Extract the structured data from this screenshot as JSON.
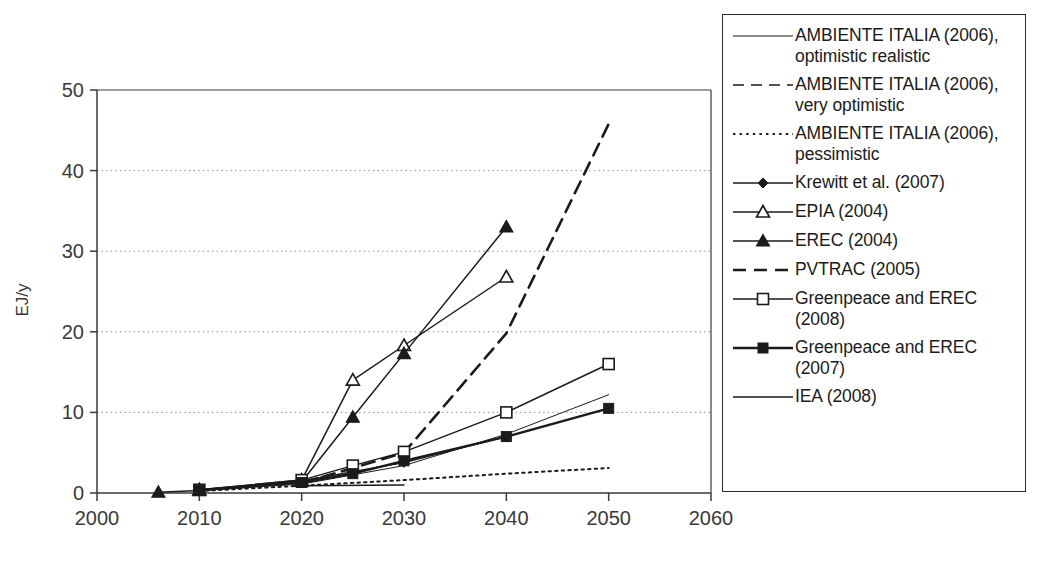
{
  "chart_data": {
    "type": "line",
    "title": "",
    "xlabel": "",
    "ylabel": "EJ/y",
    "xlim": [
      2000,
      2060
    ],
    "ylim": [
      0,
      50
    ],
    "xticks": [
      2000,
      2010,
      2020,
      2030,
      2040,
      2050,
      2060
    ],
    "yticks": [
      0,
      10,
      20,
      30,
      40,
      50
    ],
    "grid": "horizontal-dotted",
    "legend_position": "right-outside",
    "series": [
      {
        "name": "AMBIENTE ITALIA (2006), optimistic realistic",
        "style": "thin-solid",
        "marker": "none",
        "x": [
          2010,
          2020,
          2030,
          2040,
          2050
        ],
        "y": [
          0.3,
          1.1,
          3.4,
          7.3,
          12.2
        ]
      },
      {
        "name": "AMBIENTE ITALIA (2006), very optimistic",
        "style": "dashed",
        "marker": "none",
        "x": [
          2010,
          2020,
          2025
        ],
        "y": [
          0.4,
          1.4,
          3.0
        ]
      },
      {
        "name": "AMBIENTE ITALIA (2006), pessimistic",
        "style": "dotted",
        "marker": "none",
        "x": [
          2010,
          2020,
          2030,
          2040,
          2050
        ],
        "y": [
          0.25,
          0.9,
          1.6,
          2.4,
          3.1
        ]
      },
      {
        "name": "Krewitt et al. (2007)",
        "style": "solid",
        "marker": "filled-diamond",
        "x": [
          2010,
          2020,
          2030,
          2040
        ],
        "y": [
          0.35,
          1.5,
          3.8,
          7.0
        ]
      },
      {
        "name": "EPIA (2004)",
        "style": "solid",
        "marker": "open-triangle",
        "x": [
          2010,
          2020,
          2025,
          2030,
          2040
        ],
        "y": [
          0.4,
          1.6,
          14.0,
          18.3,
          26.8
        ]
      },
      {
        "name": "EREC (2004)",
        "style": "solid",
        "marker": "filled-triangle",
        "x": [
          2006,
          2010,
          2020,
          2025,
          2030,
          2040
        ],
        "y": [
          0.1,
          0.3,
          1.4,
          9.4,
          17.3,
          33.0
        ]
      },
      {
        "name": "PVTRAC (2005)",
        "style": "bold-dashed",
        "marker": "none",
        "x": [
          2020,
          2030,
          2040,
          2050
        ],
        "y": [
          1.2,
          5.0,
          19.8,
          45.8
        ]
      },
      {
        "name": "Greenpeace and EREC (2008)",
        "style": "solid",
        "marker": "open-square",
        "x": [
          2010,
          2020,
          2025,
          2030,
          2040,
          2050
        ],
        "y": [
          0.4,
          1.6,
          3.4,
          5.1,
          10.0,
          16.0
        ]
      },
      {
        "name": "Greenpeace and EREC (2007)",
        "style": "bold-solid",
        "marker": "filled-square",
        "x": [
          2010,
          2020,
          2025,
          2030,
          2040,
          2050
        ],
        "y": [
          0.35,
          1.3,
          2.4,
          4.0,
          7.0,
          10.5
        ]
      },
      {
        "name": "IEA (2008)",
        "style": "solid",
        "marker": "none",
        "x": [
          2020,
          2030
        ],
        "y": [
          0.9,
          1.0
        ]
      }
    ]
  },
  "legend": {
    "items": [
      {
        "label": "AMBIENTE ITALIA (2006), optimistic realistic",
        "sample": "thin-solid",
        "marker": "none"
      },
      {
        "label": "AMBIENTE ITALIA (2006), very optimistic",
        "sample": "dashed",
        "marker": "none"
      },
      {
        "label": "AMBIENTE ITALIA (2006), pessimistic",
        "sample": "dotted",
        "marker": "none"
      },
      {
        "label": "Krewitt et al. (2007)",
        "sample": "solid",
        "marker": "filled-diamond"
      },
      {
        "label": "EPIA (2004)",
        "sample": "solid",
        "marker": "open-triangle"
      },
      {
        "label": "EREC (2004)",
        "sample": "solid",
        "marker": "filled-triangle"
      },
      {
        "label": "PVTRAC (2005)",
        "sample": "bold-dashed",
        "marker": "none"
      },
      {
        "label": "Greenpeace and EREC (2008)",
        "sample": "solid",
        "marker": "open-square"
      },
      {
        "label": "Greenpeace and EREC (2007)",
        "sample": "bold-solid",
        "marker": "filled-square"
      },
      {
        "label": "IEA (2008)",
        "sample": "solid",
        "marker": "none"
      }
    ]
  },
  "colors": {
    "ink": "#1b1b1b",
    "axis": "#3a3a3a",
    "grid": "#8a8a8a",
    "background": "#ffffff"
  }
}
